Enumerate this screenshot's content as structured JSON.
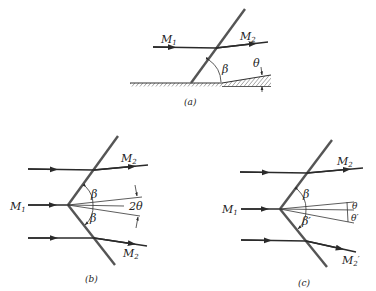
{
  "figure": {
    "panels": [
      {
        "id": "a",
        "caption": "(a)",
        "labels": {
          "incoming": "M",
          "incoming_sub": "1",
          "outgoing": "M",
          "outgoing_sub": "2",
          "angle_beta": "β",
          "angle_theta": "θ"
        }
      },
      {
        "id": "b",
        "caption": "(b)",
        "labels": {
          "incoming": "M",
          "incoming_sub": "1",
          "outgoing_top": "M",
          "outgoing_top_sub": "2",
          "outgoing_bottom": "M",
          "outgoing_bottom_sub": "2",
          "angle_beta_top": "β",
          "angle_beta_bottom": "β",
          "angle_spread": "2θ"
        }
      },
      {
        "id": "c",
        "caption": "(c)",
        "labels": {
          "incoming": "M",
          "incoming_sub": "1",
          "outgoing_top": "M",
          "outgoing_top_sub": "2",
          "outgoing_bottom": "M",
          "outgoing_bottom_sub": "2",
          "outgoing_bottom_prime": "′",
          "angle_beta_top": "β",
          "angle_beta_bottom": "β′",
          "angle_theta": "θ",
          "angle_theta_prime": "θ′"
        }
      }
    ]
  }
}
